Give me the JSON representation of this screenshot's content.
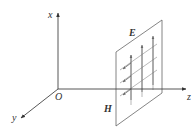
{
  "diagram": {
    "axes": {
      "x_label": "x",
      "y_label": "y",
      "z_label": "z",
      "origin_label": "O"
    },
    "field_labels": {
      "electric": "E",
      "magnetic": "H"
    },
    "colors": {
      "axis": "#444444",
      "plane": "#666666",
      "grid": "#888888",
      "arrow": "#555555",
      "background": "#ffffff"
    }
  }
}
